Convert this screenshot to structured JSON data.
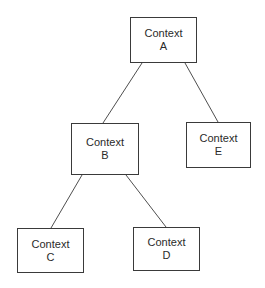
{
  "diagram": {
    "type": "tree",
    "nodes": [
      {
        "id": "A",
        "line1": "Context",
        "line2": "A",
        "x": 130,
        "y": 17,
        "w": 67,
        "h": 46
      },
      {
        "id": "B",
        "line1": "Context",
        "line2": "B",
        "x": 71,
        "y": 123,
        "w": 68,
        "h": 52
      },
      {
        "id": "E",
        "line1": "Context",
        "line2": "E",
        "x": 186,
        "y": 122,
        "w": 65,
        "h": 46
      },
      {
        "id": "C",
        "line1": "Context",
        "line2": "C",
        "x": 17,
        "y": 228,
        "w": 67,
        "h": 45
      },
      {
        "id": "D",
        "line1": "Context",
        "line2": "D",
        "x": 133,
        "y": 227,
        "w": 67,
        "h": 44
      }
    ],
    "edges": [
      {
        "from": "A",
        "to": "B",
        "x1": 142,
        "y1": 63,
        "x2": 103,
        "y2": 123
      },
      {
        "from": "A",
        "to": "E",
        "x1": 185,
        "y1": 63,
        "x2": 218,
        "y2": 122
      },
      {
        "from": "B",
        "to": "C",
        "x1": 82,
        "y1": 175,
        "x2": 51,
        "y2": 228
      },
      {
        "from": "B",
        "to": "D",
        "x1": 126,
        "y1": 175,
        "x2": 166,
        "y2": 227
      }
    ],
    "colors": {
      "line": "#3a3a3a",
      "text": "#2a2a2a",
      "background": "#ffffff"
    }
  }
}
